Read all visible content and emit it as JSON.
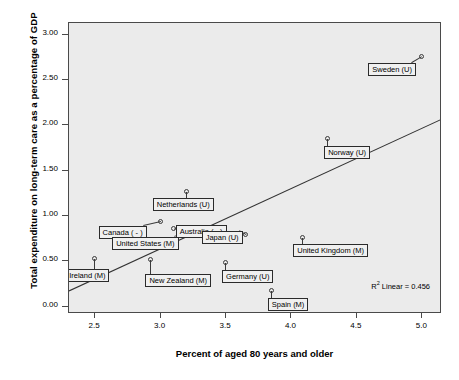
{
  "chart_data": {
    "type": "scatter",
    "title": "",
    "xlabel": "Percent of aged 80 years and older",
    "ylabel": "Total expenditure on long-term care as a percentage of GDP",
    "xlim": [
      2.3,
      5.15
    ],
    "ylim": [
      -0.08,
      3.13
    ],
    "xticks": [
      "2.5",
      "3.0",
      "3.5",
      "4.0",
      "4.5",
      "5.0"
    ],
    "xtick_values": [
      2.5,
      3.0,
      3.5,
      4.0,
      4.5,
      5.0
    ],
    "yticks": [
      "0.00",
      "0.50",
      "1.00",
      "1.50",
      "2.00",
      "2.50",
      "3.00"
    ],
    "ytick_values": [
      0.0,
      0.5,
      1.0,
      1.5,
      2.0,
      2.5,
      3.0
    ],
    "grid": false,
    "legend": "none",
    "annotation": "R² Linear = 0.456",
    "annotation_r2": 0.456,
    "trendline": {
      "type": "linear",
      "x_start": 2.3,
      "y_start": 0.175,
      "x_end": 5.15,
      "y_end": 2.07
    },
    "points": [
      {
        "label": "Ireland (M)",
        "x": 2.5,
        "y": 0.53
      },
      {
        "label": "New Zealand (M)",
        "x": 2.93,
        "y": 0.52
      },
      {
        "label": "Canada ( - )",
        "x": 3.0,
        "y": 0.93
      },
      {
        "label": "United States (M)",
        "x": 3.18,
        "y": 0.8
      },
      {
        "label": "Australia ( - )",
        "x": 3.1,
        "y": 0.86
      },
      {
        "label": "Netherlands (U)",
        "x": 3.2,
        "y": 1.27
      },
      {
        "label": "Germany (U)",
        "x": 3.5,
        "y": 0.48
      },
      {
        "label": "Japan (U)",
        "x": 3.65,
        "y": 0.79
      },
      {
        "label": "Spain (M)",
        "x": 3.85,
        "y": 0.17
      },
      {
        "label": "United Kingdom (M)",
        "x": 4.09,
        "y": 0.76
      },
      {
        "label": "Norway (U)",
        "x": 4.28,
        "y": 1.85
      },
      {
        "label": "Sweden (U)",
        "x": 5.0,
        "y": 2.75
      }
    ]
  }
}
